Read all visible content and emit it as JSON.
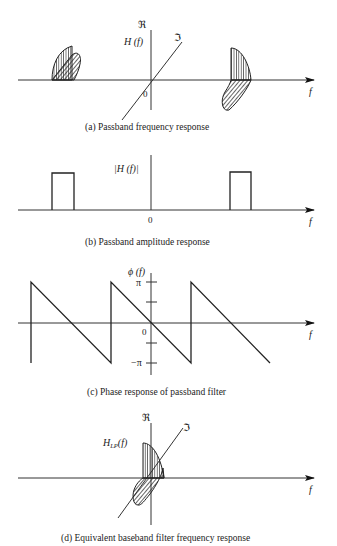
{
  "figure": {
    "panels": [
      {
        "id": "a",
        "caption": "(a) Passband frequency response",
        "y_axis_label": "ℜ",
        "z_axis_label": "ℑ",
        "function_label": "H (f)",
        "origin_label": "0",
        "x_axis_label": "f"
      },
      {
        "id": "b",
        "caption": "(b) Passband amplitude response",
        "function_label": "|H (f)|",
        "origin_label": "0",
        "x_axis_label": "f"
      },
      {
        "id": "c",
        "caption": "(c) Phase response of passband filter",
        "function_label": "ϕ (f)",
        "tick_pi": "π",
        "tick_neg_pi": "−π",
        "origin_label": "0",
        "x_axis_label": "f"
      },
      {
        "id": "d",
        "caption": "(d) Equivalent baseband filter frequency response",
        "y_axis_label": "ℜ",
        "z_axis_label": "ℑ",
        "function_label": "H",
        "function_subscript": "LP",
        "function_arg": "(f)",
        "x_axis_label": "f"
      }
    ]
  }
}
